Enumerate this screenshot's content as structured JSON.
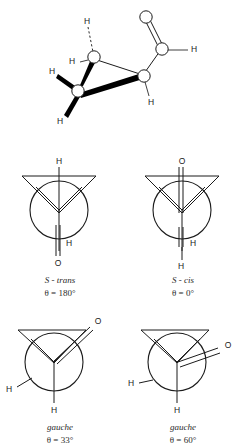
{
  "figure": {
    "background_color": "#ffffff",
    "ink_color": "#1b1b1b",
    "title": ""
  },
  "perspective_structure": {
    "name": "three-dimensional-conformer",
    "atom_labels": [
      {
        "id": "h-hydroxyl-donor",
        "text": "H"
      },
      {
        "id": "h-on-hydroxymethyl-carbon",
        "text": "H"
      },
      {
        "id": "h-methylene-upper-left",
        "text": "H"
      },
      {
        "id": "h-methylene-lower-left",
        "text": "H"
      },
      {
        "id": "h-on-carbinol-carbon",
        "text": "H"
      },
      {
        "id": "o-carbonyl",
        "text": "O"
      },
      {
        "id": "o-hydroxyl",
        "text": "O"
      },
      {
        "id": "h-acid-hydroxyl",
        "text": "H"
      }
    ],
    "bond_types": [
      "plain",
      "bold-wedge",
      "dashed-hydrogen-bond",
      "double"
    ]
  },
  "newman_projections": [
    {
      "id": "s-trans",
      "name": "S - trans",
      "angle": "θ = 180°",
      "front_substituents": [
        "H",
        "H",
        "O"
      ],
      "top_atom": "H",
      "bottom_atom": "O",
      "bottom_atom_secondary": "H",
      "double_bond": true
    },
    {
      "id": "s-cis",
      "name": "S - cis",
      "angle": "θ = 0°",
      "front_substituents": [
        "O",
        "H",
        "H"
      ],
      "top_atom": "O",
      "bottom_atom": "H",
      "bottom_atom_secondary": "H",
      "double_bond": true
    },
    {
      "id": "gauche-33",
      "name": "gauche",
      "angle": "θ = 33°",
      "front_substituents": [
        "O",
        "H",
        "H"
      ],
      "top_atom": "O",
      "left_atom": "H",
      "bottom_atom": "H",
      "double_bond": true
    },
    {
      "id": "gauche-60",
      "name": "gauche",
      "angle": "θ = 60°",
      "front_substituents": [
        "O",
        "H",
        "H"
      ],
      "right_atom": "O",
      "left_atom": "H",
      "bottom_atom": "H",
      "double_bond": true
    }
  ]
}
